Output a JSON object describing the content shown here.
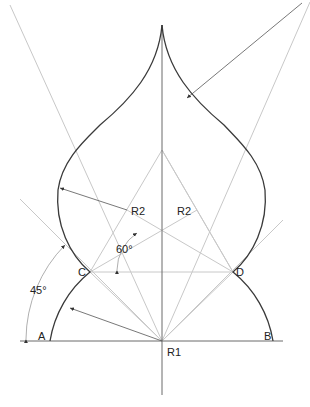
{
  "diagram": {
    "labels": {
      "point_a": "A",
      "point_b": "B",
      "point_c": "C",
      "point_d": "D",
      "radius_1": "R1",
      "radius_2_left": "R2",
      "radius_2_right": "R2",
      "angle_45": "45°",
      "angle_60": "60°"
    },
    "colors": {
      "outline": "#3a3a3a",
      "construction": "#c8c8c8",
      "axis": "#6a6a6a",
      "text": "#222222"
    }
  }
}
